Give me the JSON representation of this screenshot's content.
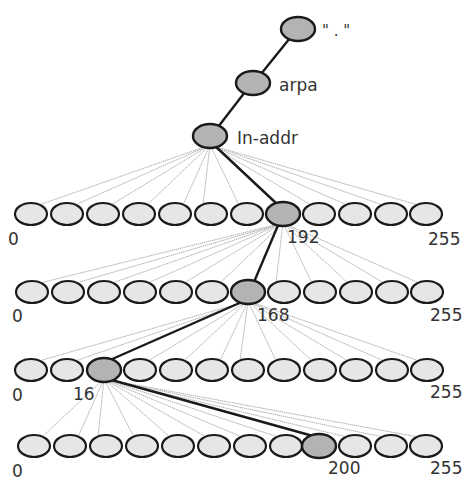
{
  "colors": {
    "background": "#ffffff",
    "node_fill": "#e6e6e6",
    "highlight_fill": "#b3b3b3",
    "node_stroke": "#1a1a1a",
    "path_line": "#1a1a1a",
    "fan_line": "#b0b0b0",
    "label": "#333333"
  },
  "top_nodes": [
    {
      "id": "root",
      "label": "\" . \"",
      "cx": 298,
      "cy": 29,
      "label_x": 322,
      "label_y": 36
    },
    {
      "id": "arpa",
      "label": "arpa",
      "cx": 253,
      "cy": 83,
      "label_x": 279,
      "label_y": 91
    },
    {
      "id": "in-addr",
      "label": "In-addr",
      "cx": 210,
      "cy": 136,
      "label_x": 237,
      "label_y": 144
    }
  ],
  "rows": [
    {
      "level": 1,
      "parent": {
        "cx": 210,
        "cy": 136
      },
      "cy": 214,
      "xs": [
        31,
        67,
        103,
        139,
        175,
        211,
        247,
        283,
        319,
        355,
        391,
        426
      ],
      "highlight_index": 7,
      "labels": [
        {
          "text": "0",
          "x": 8,
          "y": 245
        },
        {
          "text": "192",
          "x": 287,
          "y": 243
        },
        {
          "text": "255",
          "x": 428,
          "y": 245
        }
      ]
    },
    {
      "level": 2,
      "parent": {
        "cx": 283,
        "cy": 214
      },
      "cy": 292,
      "xs": [
        32,
        68,
        104,
        140,
        176,
        212,
        248,
        284,
        320,
        356,
        392,
        427
      ],
      "highlight_index": 6,
      "labels": [
        {
          "text": "0",
          "x": 12,
          "y": 322
        },
        {
          "text": "168",
          "x": 257,
          "y": 321
        },
        {
          "text": "255",
          "x": 430,
          "y": 321
        }
      ]
    },
    {
      "level": 3,
      "parent": {
        "cx": 248,
        "cy": 292
      },
      "cy": 370,
      "xs": [
        31,
        67,
        104,
        140,
        176,
        212,
        248,
        284,
        320,
        356,
        392,
        427
      ],
      "highlight_index": 2,
      "labels": [
        {
          "text": "0",
          "x": 12,
          "y": 401
        },
        {
          "text": "16",
          "x": 73,
          "y": 400
        },
        {
          "text": "255",
          "x": 430,
          "y": 398
        }
      ]
    },
    {
      "level": 4,
      "parent": {
        "cx": 104,
        "cy": 370
      },
      "cy": 446,
      "xs": [
        34,
        70,
        106,
        142,
        178,
        214,
        250,
        286,
        319,
        355,
        391,
        426
      ],
      "highlight_index": 8,
      "labels": [
        {
          "text": "0",
          "x": 12,
          "y": 477
        },
        {
          "text": "200",
          "x": 328,
          "y": 474
        },
        {
          "text": "255",
          "x": 430,
          "y": 474
        }
      ]
    }
  ]
}
